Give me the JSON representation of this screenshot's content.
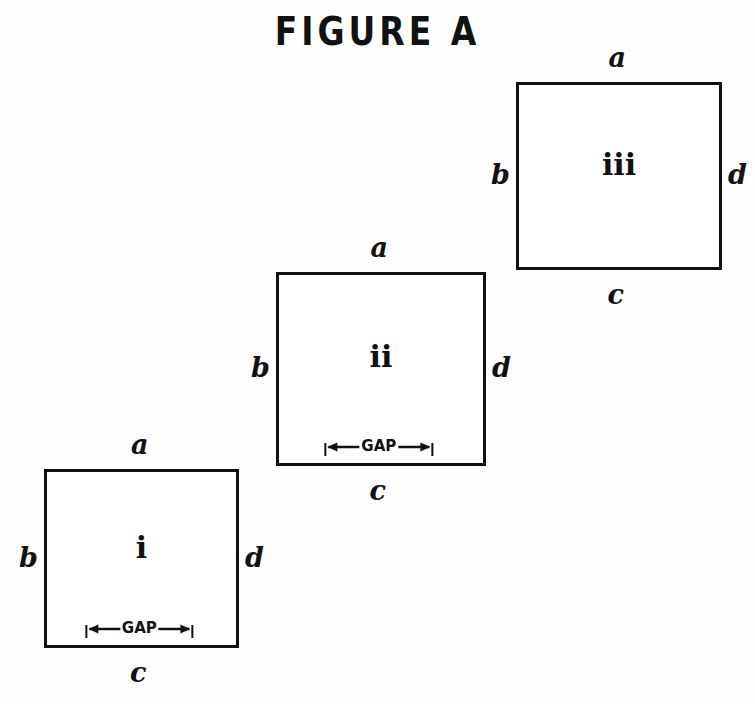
{
  "figure": {
    "title": "FIGURE A",
    "stroke_color": "#101010",
    "background_color": "#fefefe"
  },
  "panels": [
    {
      "id": "panel-iii",
      "numeral": "iii",
      "edges": {
        "top": "a",
        "left": "b",
        "bottom": "c",
        "right": "d"
      },
      "gap": {
        "present": false,
        "label": ""
      }
    },
    {
      "id": "panel-ii",
      "numeral": "ii",
      "edges": {
        "top": "a",
        "left": "b",
        "bottom": "c",
        "right": "d"
      },
      "gap": {
        "present": true,
        "label": "GAP"
      }
    },
    {
      "id": "panel-i",
      "numeral": "i",
      "edges": {
        "top": "a",
        "left": "b",
        "bottom": "c",
        "right": "d"
      },
      "gap": {
        "present": true,
        "label": "GAP"
      }
    }
  ]
}
